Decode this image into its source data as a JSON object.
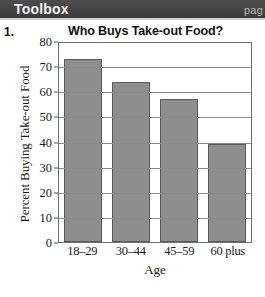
{
  "header": {
    "title": "Toolbox",
    "page_label": "pag"
  },
  "item": {
    "number": "1."
  },
  "chart_data": {
    "type": "bar",
    "title": "Who Buys Take-out Food?",
    "xlabel": "Age",
    "ylabel": "Percent Buying Take-out Food",
    "categories": [
      "18‒29",
      "30‒44",
      "45‒59",
      "60 plus"
    ],
    "values": [
      73,
      63.5,
      57,
      39
    ],
    "ylim": [
      0,
      80
    ],
    "yticks": [
      0,
      10,
      20,
      30,
      40,
      50,
      60,
      70,
      80
    ],
    "ytick_labels": [
      "0",
      "10",
      "20",
      "30",
      "40",
      "50",
      "60",
      "70",
      "80"
    ],
    "grid": true,
    "legend": null,
    "bar_color": "#8e8e8e",
    "bar_border_color": "#5a5a5a",
    "axis_color": "#6f6f6f"
  }
}
